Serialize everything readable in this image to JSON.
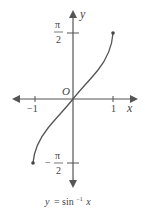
{
  "diagram": {
    "caption": {
      "lhs": "y",
      "eq": "= sin",
      "sup": "−1",
      "arg": "x"
    },
    "axes": {
      "x_label": "x",
      "y_label": "y",
      "origin_label": "O",
      "x_ticks": [
        {
          "label": "−1",
          "value": -1
        },
        {
          "label": "1",
          "value": 1
        }
      ],
      "y_ticks": [
        {
          "num": "π",
          "den": "2",
          "sign": "",
          "value": 1.5708
        },
        {
          "num": "π",
          "den": "2",
          "sign": "−",
          "value": -1.5708
        }
      ]
    },
    "curve": {
      "function": "y = arcsin(x)",
      "domain": [
        -1,
        1
      ],
      "range": [
        -1.5708,
        1.5708
      ],
      "endpoints": [
        [
          -1,
          -1.5708
        ],
        [
          1,
          1.5708
        ]
      ]
    },
    "colors": {
      "axis": "#555555",
      "curve": "#555555",
      "text": "#444444"
    }
  }
}
